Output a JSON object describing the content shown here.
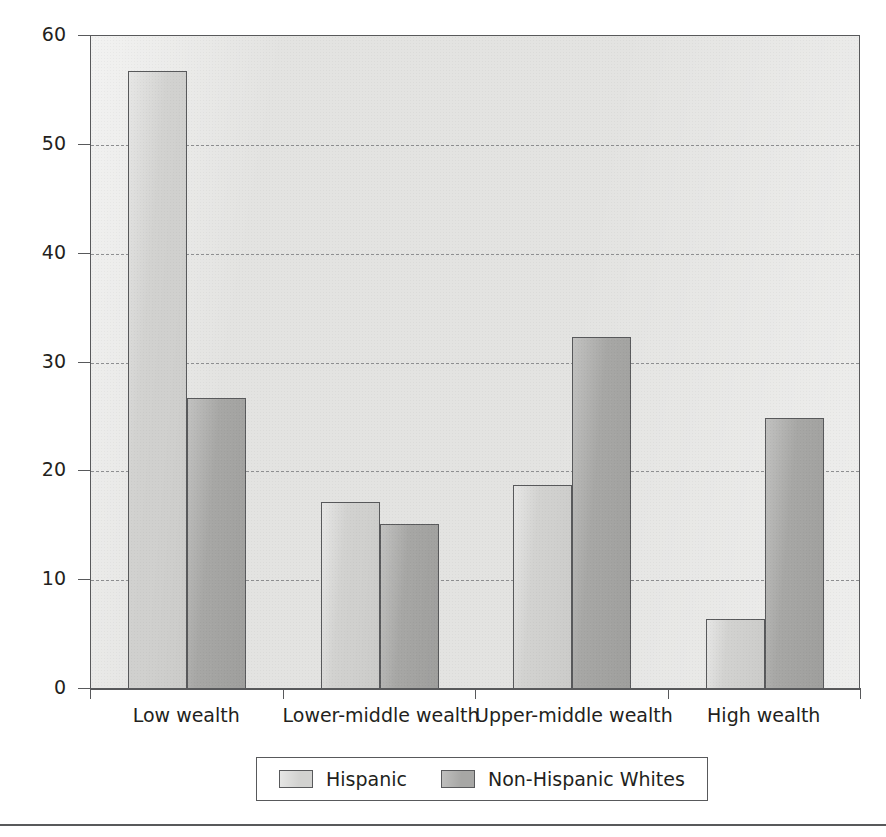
{
  "chart_data": {
    "type": "bar",
    "title": "",
    "xlabel": "",
    "ylabel": "Percent",
    "ylim": [
      0,
      60
    ],
    "yticks": [
      0,
      10,
      20,
      30,
      40,
      50,
      60
    ],
    "ytick_labels": [
      "0",
      "10",
      "20",
      "30",
      "40",
      "50",
      "60"
    ],
    "grid": "horizontal-dashed",
    "legend_position": "bottom-center",
    "categories": [
      "Low wealth",
      "Lower-middle wealth",
      "Upper-middle wealth",
      "High wealth"
    ],
    "series": [
      {
        "name": "Hispanic",
        "color": "#d2d2d0",
        "values": [
          56.8,
          17.2,
          18.7,
          6.4
        ]
      },
      {
        "name": "Non-Hispanic Whites",
        "color": "#a7a7a5",
        "values": [
          26.7,
          15.2,
          32.3,
          24.9
        ]
      }
    ]
  },
  "axes": {
    "y_axis_label": "Percent"
  },
  "legend": {
    "entries": [
      {
        "label": "Hispanic",
        "swatch": "hispanic"
      },
      {
        "label": "Non-Hispanic Whites",
        "swatch": "nhw"
      }
    ]
  },
  "colors": {
    "hispanic": "#d2d2d0",
    "non_hispanic_whites": "#a7a7a5",
    "plot_background": "#e3e3e1",
    "axis": "#58595b",
    "text": "#231f20"
  }
}
